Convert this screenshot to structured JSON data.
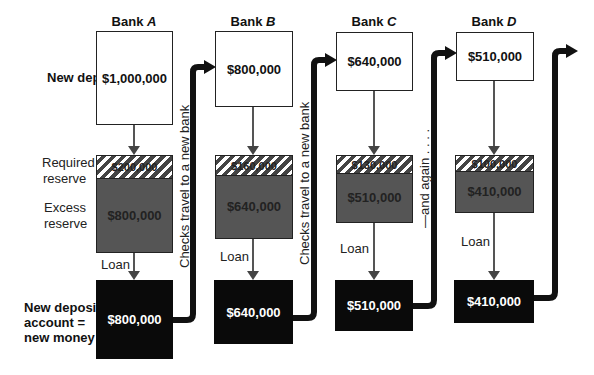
{
  "row_labels": {
    "new_deposits": "New deposits",
    "required_reserve_1": "Required",
    "required_reserve_2": "reserve",
    "excess_reserve_1": "Excess",
    "excess_reserve_2": "reserve",
    "new_money_1": "New deposit",
    "new_money_2": "account =",
    "new_money_3": "new money"
  },
  "loan_label": "Loan",
  "connector_labels": {
    "a_to_b": "Checks travel to a new bank",
    "b_to_c": "Checks travel to a new bank",
    "c_to_d": "—and again . . . ."
  },
  "banks": [
    {
      "prefix": "Bank ",
      "letter": "A",
      "deposit": "$1,000,000",
      "required": "$200,000",
      "excess": "$800,000",
      "new_money": "$800,000"
    },
    {
      "prefix": "Bank ",
      "letter": "B",
      "deposit": "$800,000",
      "required": "$160,000",
      "excess": "$640,000",
      "new_money": "$640,000"
    },
    {
      "prefix": "Bank ",
      "letter": "C",
      "deposit": "$640,000",
      "required": "$130,000",
      "excess": "$510,000",
      "new_money": "$510,000"
    },
    {
      "prefix": "Bank ",
      "letter": "D",
      "deposit": "$510,000",
      "required": "$100,000",
      "excess": "$410,000",
      "new_money": "$410,000"
    }
  ],
  "colors": {
    "deposit_box": "#ffffff",
    "reserve_box": "#555555",
    "new_money_box": "#0a0a0a",
    "check_flow_arrow": "#111111"
  }
}
